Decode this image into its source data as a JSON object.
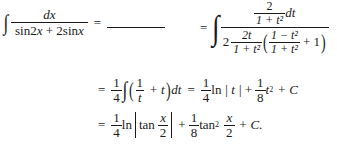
{
  "problem": {
    "integrand_numerator": "dx",
    "integrand_denominator": "sin2x + 2sinx",
    "equals": "=",
    "answer_blank": ""
  },
  "line1_rhs": {
    "outer_numerator_num": "2",
    "outer_numerator_den": "1 + t²",
    "outer_numerator_dt": "dt",
    "den_coeff": "2",
    "den_frac1_num": "2t",
    "den_frac1_den": "1 + t²",
    "den_frac2_num": "1 − t²",
    "den_frac2_den": "1 + t²",
    "den_plus_one": "+ 1"
  },
  "line2": {
    "equals": "=",
    "coeff_num": "1",
    "coeff_den": "4",
    "inner_num": "1",
    "inner_den": "t",
    "plus_t": "+ t",
    "dt": "dt",
    "equals2": "=",
    "ln_coeff_num": "1",
    "ln_coeff_den": "4",
    "ln": "ln",
    "abs_t": "| t |",
    "plus": "+",
    "sq_coeff_num": "1",
    "sq_coeff_den": "8",
    "t_var": "t",
    "exp": "2",
    "plus_c": "+ C"
  },
  "line3": {
    "equals": "=",
    "ln_coeff_num": "1",
    "ln_coeff_den": "4",
    "ln": "ln",
    "tan": "tan",
    "x_num": "x",
    "x_den": "2",
    "plus": "+",
    "sq_coeff_num": "1",
    "sq_coeff_den": "8",
    "tan2": "tan",
    "exp": "2",
    "x2_num": "x",
    "x2_den": "2",
    "plus_c": "+ C."
  }
}
